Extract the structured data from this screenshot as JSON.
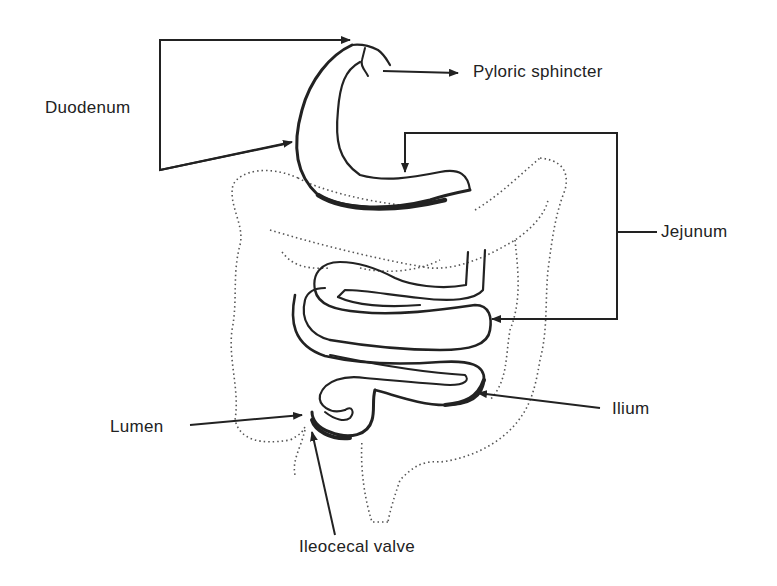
{
  "diagram": {
    "type": "anatomical-line-drawing",
    "labels": {
      "duodenum": "Duodenum",
      "pyloric_sphincter": "Pyloric sphincter",
      "jejunum": "Jejunum",
      "ilium": "Ilium",
      "lumen": "Lumen",
      "ileocecal_valve": "Ileocecal valve"
    },
    "colors": {
      "line": "#222222",
      "dotted_outline": "#555555",
      "background": "#ffffff"
    }
  }
}
